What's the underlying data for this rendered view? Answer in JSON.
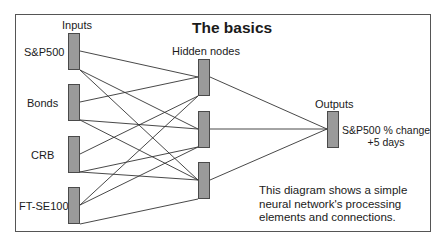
{
  "title": "The basics",
  "layers": {
    "inputs_label": "Inputs",
    "hidden_label": "Hidden nodes",
    "outputs_label": "Outputs"
  },
  "inputs": [
    {
      "label": "S&P500"
    },
    {
      "label": "Bonds"
    },
    {
      "label": "CRB"
    },
    {
      "label": "FT-SE100"
    }
  ],
  "hidden_nodes": 3,
  "output": {
    "line1": "S&P500 % change",
    "line2": "+5 days"
  },
  "caption": {
    "line1": "This diagram shows a simple",
    "line2": "neural network's processing",
    "line3": "elements and connections."
  },
  "colors": {
    "node_fill": "#9a9a9a",
    "node_border": "#4a4a4a",
    "wire": "#333333",
    "frame": "#555555"
  }
}
